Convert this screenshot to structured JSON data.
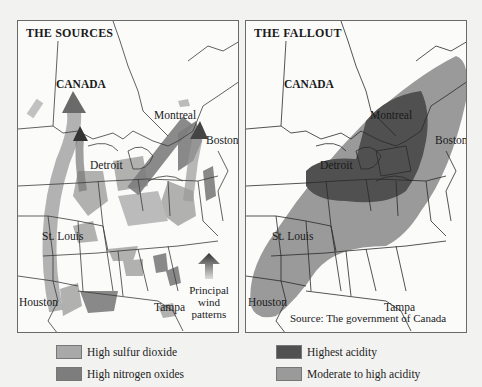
{
  "colors": {
    "background": "#f2f2f0",
    "map_land": "#fbfbfa",
    "border_lines": "#3a3a3a",
    "high_sulfur_dioxide": "#a9a9a9",
    "high_nitrogen_oxides": "#7d7d7d",
    "highest_acidity": "#505050",
    "moderate_to_high_acidity": "#9a9a9a"
  },
  "left_panel": {
    "title": "THE SOURCES",
    "labels": {
      "canada": "CANADA",
      "montreal": "Montreal",
      "boston": "Boston",
      "detroit": "Detroit",
      "st_louis": "St. Louis",
      "houston": "Houston",
      "tampa": "Tampa"
    },
    "wind_legend": {
      "icon": "up-arrow-icon",
      "line1": "Principal",
      "line2": "wind",
      "line3": "patterns"
    }
  },
  "right_panel": {
    "title": "THE FALLOUT",
    "labels": {
      "canada": "CANADA",
      "montreal": "Montreal",
      "boston": "Boston",
      "detroit": "Detroit",
      "st_louis": "St. Louis",
      "houston": "Houston",
      "tampa": "Tampa"
    },
    "source": "Source:  The government of Canada"
  },
  "legend": {
    "left": [
      {
        "label": "High sulfur dioxide",
        "color": "#a9a9a9"
      },
      {
        "label": "High nitrogen oxides",
        "color": "#7d7d7d"
      }
    ],
    "right": [
      {
        "label": "Highest acidity",
        "color": "#505050"
      },
      {
        "label": "Moderate to high acidity",
        "color": "#9a9a9a"
      }
    ]
  }
}
